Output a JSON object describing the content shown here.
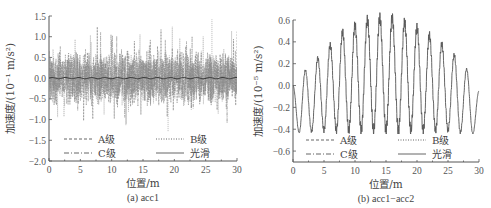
{
  "chart_data": [
    {
      "type": "line",
      "caption": "(a) acc1",
      "xlabel": "位置/m",
      "ylabel": "加速度/(10⁻¹ m/s²)",
      "xlim": [
        0,
        30
      ],
      "ylim": [
        -2.0,
        1.5
      ],
      "xticks": [
        "0",
        "5",
        "10",
        "15",
        "20",
        "25",
        "30"
      ],
      "yticks": [
        "1.5",
        "1.0",
        "0.5",
        "0.0",
        "−0.5",
        "−1.0",
        "−1.5",
        "−2.0"
      ],
      "grid": false,
      "legend": [
        "A级",
        "B级",
        "C级",
        "光滑"
      ],
      "legend_position": "lower center",
      "series": [
        {
          "name": "A级",
          "style": "dashed",
          "description": "random noisy signal, amplitude ~±0.5, peaks to ~1.3"
        },
        {
          "name": "B级",
          "style": "dotted",
          "description": "random noisy signal, peaks ~1.4 at x≈26, min ~-1.3 at x≈19"
        },
        {
          "name": "C级",
          "style": "dash-dot",
          "description": "random noisy signal, amplitude ~±0.7"
        },
        {
          "name": "光滑",
          "style": "solid",
          "description": "near zero, ~0.0 throughout"
        }
      ],
      "key_points": {
        "max": [
          26,
          1.42
        ],
        "min": [
          19,
          -1.3
        ]
      }
    },
    {
      "type": "line",
      "caption": "(b) acc1−acc2",
      "xlabel": "位置/m",
      "ylabel": "加速度/(10⁻⁵ m/s²)",
      "xlim": [
        0,
        30
      ],
      "ylim": [
        -0.7,
        0.6
      ],
      "xticks": [
        "0",
        "5",
        "10",
        "15",
        "20",
        "25",
        "30"
      ],
      "yticks": [
        "0.6",
        "0.4",
        "0.2",
        "0.0",
        "−0.2",
        "−0.4",
        "−0.6"
      ],
      "grid": false,
      "legend": [
        "A级",
        "B级",
        "C级",
        "光滑"
      ],
      "legend_position": "lower center",
      "series": [
        {
          "name": "光滑",
          "style": "solid",
          "description": "oscillation period ~2m, envelope peaking ~0.62 at x≈15-16, troughs ~-0.42; all series overlap"
        }
      ],
      "peaks": {
        "x": [
          2,
          4,
          6,
          8,
          10,
          12,
          14,
          16,
          18,
          20,
          22,
          24,
          26,
          28
        ],
        "y": [
          0.14,
          0.25,
          0.37,
          0.49,
          0.55,
          0.6,
          0.62,
          0.62,
          0.58,
          0.53,
          0.46,
          0.38,
          0.28,
          0.15
        ]
      },
      "troughs": {
        "x": [
          1,
          3,
          5,
          7,
          9,
          11,
          13,
          15,
          17,
          19,
          21,
          23,
          25,
          27,
          29
        ],
        "y": [
          -0.43,
          -0.42,
          -0.41,
          -0.41,
          -0.41,
          -0.41,
          -0.41,
          -0.41,
          -0.41,
          -0.41,
          -0.41,
          -0.41,
          -0.41,
          -0.43,
          -0.44
        ]
      }
    }
  ]
}
